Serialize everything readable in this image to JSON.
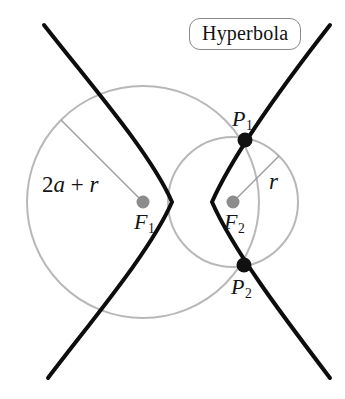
{
  "figure": {
    "title": "Hyperbola",
    "background_color": "#ffffff",
    "curve_color": "#0d0d0d",
    "circle_color": "#b4b4b4",
    "radius_line_color": "#9a9a9a",
    "focus_dot_color": "#8c8c8c",
    "point_dot_color": "#111111",
    "width": 345,
    "height": 399
  },
  "labels": {
    "large_radius": {
      "prefix": "2",
      "var_a": "a",
      "operator": " + ",
      "var_r": "r",
      "full": "2a + r"
    },
    "small_radius": {
      "var": "r",
      "full": "r"
    },
    "focus_1": {
      "base": "F",
      "sub": "1",
      "full": "F1"
    },
    "focus_2": {
      "base": "F",
      "sub": "2",
      "full": "F2"
    },
    "point_1": {
      "base": "P",
      "sub": "1",
      "full": "P1"
    },
    "point_2": {
      "base": "P",
      "sub": "2",
      "full": "P2"
    }
  },
  "geometry": {
    "center": {
      "x": 192,
      "y": 202
    },
    "focus_1": {
      "x": 143,
      "y": 202
    },
    "focus_2": {
      "x": 233,
      "y": 202
    },
    "point_1": {
      "x": 245,
      "y": 140
    },
    "point_2": {
      "x": 244,
      "y": 265
    },
    "vertex_left": {
      "x": 172,
      "y": 202
    },
    "vertex_right": {
      "x": 212,
      "y": 202
    },
    "large_circle_radius": 116,
    "small_circle_radius": 65,
    "semi_major_a": 20,
    "focal_distance_c": 49
  }
}
